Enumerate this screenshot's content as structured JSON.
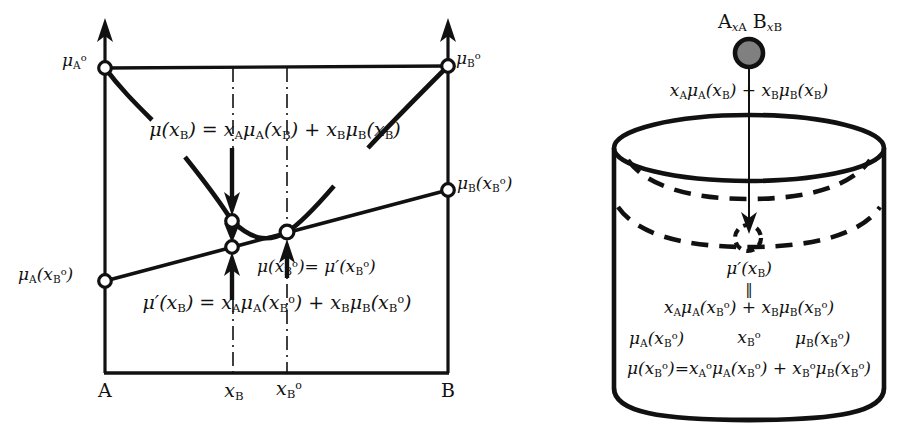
{
  "figure": {
    "type": "thermodynamic-chemical-potential-diagram",
    "panels": [
      "free-energy-composition-plot",
      "cylinder-equilibrium-schematic"
    ]
  },
  "left_panel": {
    "axis": {
      "x_endpoints": [
        "A",
        "B"
      ],
      "x_ticks": [
        {
          "label_html": "<i>x</i><sub>B</sub>",
          "value": "x_B"
        },
        {
          "label_html": "<i>x</i><sub>B</sub><sup>o</sup>",
          "value": "x_B^o"
        }
      ],
      "y_arrows": 2
    },
    "markers": {
      "mu_A_pure": "μᴬ°",
      "mu_B_pure": "μᴮ°",
      "mu_A_at_xBo": "μ_A(x_B°)",
      "mu_B_at_xBo": "μ_B(x_B°)"
    },
    "labels": {
      "mu_A0": "μᴀ°",
      "mu_B0": "μʙ°",
      "mu_A_xB0": "μᴀ(xʙ°)",
      "mu_B_xB0": "μʙ(xʙ°)",
      "x_A_end": "A",
      "x_B_end": "B",
      "tick_xB": "xʙ",
      "tick_xB0": "xʙ°"
    },
    "equations": {
      "top": "μ(xʙ) = xᴀμᴀ(xʙ) + xʙμʙ(xʙ)",
      "middle_right": "μ(xʙ°)= μ′(xʙ°)",
      "bottom": "μ′(xʙ) = xᴀμᴀ(xʙ°) + xʙμʙ(xʙ°)"
    }
  },
  "right_panel": {
    "top_label": "Aₓᴀ Bₓʙ",
    "flux_label": "xᴀμᴀ(xʙ) + xʙμʙ(xʙ)",
    "sphere": {
      "fill": "#808080",
      "stroke": "#000000"
    },
    "inner_lines": [
      "μ′(xʙ)",
      "‖",
      "xᴀμᴀ(xʙ°) + xʙμʙ(xʙ°)"
    ],
    "row_labels": {
      "left": "μᴀ(xʙ°)",
      "center": "xʙ°",
      "right": "μʙ(xʙ°)"
    },
    "bottom_equation": "μ(xʙ°)=xᴀ°μᴀ(xʙ°) + xʙ°μʙ(xʙ°)"
  },
  "colors": {
    "ink": "#111111",
    "sphere_fill": "#808080",
    "background": "#ffffff"
  }
}
